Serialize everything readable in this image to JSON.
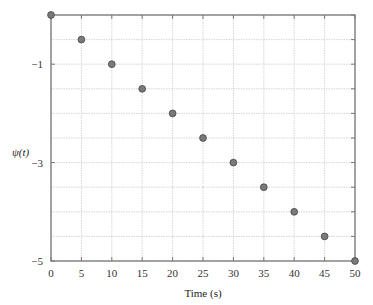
{
  "chart_data": {
    "type": "scatter",
    "title": "",
    "xlabel": "Time (s)",
    "ylabel": "ψ(t)",
    "xlim": [
      0,
      50
    ],
    "ylim": [
      -5,
      0
    ],
    "x_ticks": [
      0,
      5,
      10,
      15,
      20,
      25,
      30,
      35,
      40,
      45,
      50
    ],
    "x_tick_labels": [
      "0",
      "5",
      "10",
      "15",
      "20",
      "25",
      "30",
      "35",
      "40",
      "45",
      "50"
    ],
    "y_ticks": [
      -1,
      -3,
      -5
    ],
    "y_tick_labels": [
      "−1",
      "−3",
      "−5"
    ],
    "y_gridlines": [
      0,
      -0.5,
      -1,
      -1.5,
      -2,
      -2.5,
      -3,
      -3.5,
      -4,
      -4.5,
      -5
    ],
    "grid": true,
    "legend": null,
    "series": [
      {
        "name": "ψ(t)",
        "marker": "circle",
        "color": "#777777",
        "x": [
          0,
          5,
          10,
          15,
          20,
          25,
          30,
          35,
          40,
          45,
          50
        ],
        "y": [
          0,
          -0.5,
          -1,
          -1.5,
          -2,
          -2.5,
          -3,
          -3.5,
          -4,
          -4.5,
          -5
        ]
      }
    ]
  },
  "colors": {
    "axis": "#777777",
    "grid": "#cccccc",
    "marker_fill": "#7a7a7a",
    "marker_stroke": "#444444"
  }
}
